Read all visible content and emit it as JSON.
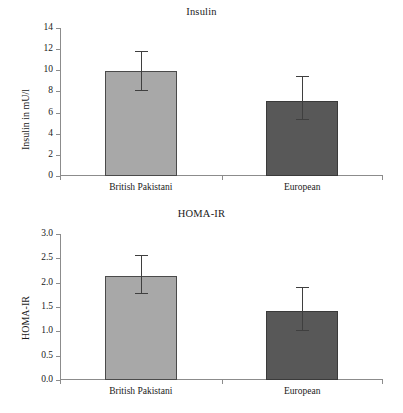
{
  "figure": {
    "background": "#ffffff",
    "colors": {
      "bar_light": "#a8a8a8",
      "bar_dark": "#585858",
      "axis": "#8c8c8c",
      "error_bar": "#3f3f3f",
      "text": "#1a1a1a"
    }
  },
  "chart_data": [
    {
      "type": "bar",
      "title": "Insulin",
      "xlabel": "",
      "ylabel": "Insulin in mU/l",
      "categories": [
        "British Pakistani",
        "European"
      ],
      "values": [
        9.9,
        7.05
      ],
      "errors_low": [
        8.1,
        5.4
      ],
      "errors_high": [
        11.8,
        9.5
      ],
      "bar_colors": [
        "#a8a8a8",
        "#585858"
      ],
      "ylim": [
        0,
        14
      ],
      "yticks": [
        "0",
        "2",
        "4",
        "6",
        "8",
        "10",
        "12",
        "14"
      ],
      "ytick_values": [
        0,
        2,
        4,
        6,
        8,
        10,
        12,
        14
      ],
      "grid": false,
      "legend": false
    },
    {
      "type": "bar",
      "title": "HOMA-IR",
      "xlabel": "",
      "ylabel": "HOMA-IR",
      "categories": [
        "British Pakistani",
        "European"
      ],
      "values": [
        2.13,
        1.41
      ],
      "errors_low": [
        1.79,
        1.03
      ],
      "errors_high": [
        2.57,
        1.91
      ],
      "bar_colors": [
        "#a8a8a8",
        "#585858"
      ],
      "ylim": [
        0,
        3.0
      ],
      "yticks": [
        "0.0",
        "0.5",
        "1.0",
        "1.5",
        "2.0",
        "2.5",
        "3.0"
      ],
      "ytick_values": [
        0,
        0.5,
        1.0,
        1.5,
        2.0,
        2.5,
        3.0
      ],
      "grid": false,
      "legend": false
    }
  ]
}
